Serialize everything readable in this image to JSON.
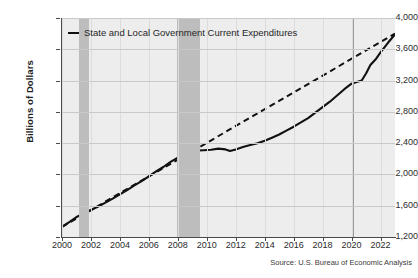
{
  "chart_data": {
    "type": "line",
    "title": "",
    "xlabel": "",
    "ylabel": "Billions of Dollars",
    "source": "Source: U.S. Bureau of Economic Analysis",
    "xlim": [
      2000,
      2023
    ],
    "ylim": [
      1200,
      4000
    ],
    "y_ticks": [
      "1,200",
      "1,600",
      "2,000",
      "2,400",
      "2,800",
      "3,200",
      "3,600",
      "4,000"
    ],
    "y_tick_values": [
      1200,
      1600,
      2000,
      2400,
      2800,
      3200,
      3600,
      4000
    ],
    "x_ticks": [
      "2000",
      "2002",
      "2004",
      "2006",
      "2008",
      "2010",
      "2012",
      "2014",
      "2016",
      "2018",
      "2020",
      "2022"
    ],
    "x_tick_values": [
      2000,
      2002,
      2004,
      2006,
      2008,
      2010,
      2012,
      2014,
      2016,
      2018,
      2020,
      2022
    ],
    "grid": true,
    "legend_position": "top-left",
    "legend": [
      "State and Local Government Current Expenditures"
    ],
    "plot_background": "#ededed",
    "line_color": "#111111",
    "recession_band_color": "#bdbdbd",
    "gridline_color": "#c9c9c9",
    "recession_bands": [
      {
        "start": 2001.2,
        "end": 2001.9
      },
      {
        "start": 2007.95,
        "end": 2009.5
      },
      {
        "start": 2020.1,
        "end": 2020.2
      }
    ],
    "series": [
      {
        "name": "State and Local Government Current Expenditures",
        "style": "solid",
        "x": [
          2000.0,
          2000.5,
          2001.0,
          2001.5,
          2002.0,
          2002.5,
          2003.0,
          2003.5,
          2004.0,
          2004.5,
          2005.0,
          2005.5,
          2006.0,
          2006.5,
          2007.0,
          2007.5,
          2008.0,
          2008.5,
          2009.0,
          2009.4,
          2009.8,
          2010.3,
          2010.8,
          2011.3,
          2011.6,
          2012.0,
          2012.5,
          2013.0,
          2013.5,
          2014.0,
          2014.5,
          2015.0,
          2015.5,
          2016.0,
          2016.5,
          2017.0,
          2017.5,
          2018.0,
          2018.5,
          2019.0,
          2019.5,
          2020.0,
          2020.3,
          2020.7,
          2021.0,
          2021.3,
          2021.7,
          2022.0,
          2022.5,
          2023.0
        ],
        "y": [
          1330,
          1390,
          1455,
          1500,
          1545,
          1590,
          1640,
          1690,
          1745,
          1800,
          1860,
          1915,
          1975,
          2040,
          2095,
          2160,
          2215,
          2265,
          2300,
          2305,
          2310,
          2315,
          2330,
          2320,
          2300,
          2320,
          2350,
          2375,
          2400,
          2430,
          2470,
          2510,
          2560,
          2610,
          2665,
          2720,
          2790,
          2860,
          2930,
          3010,
          3090,
          3160,
          3180,
          3200,
          3290,
          3400,
          3480,
          3560,
          3680,
          3790
        ]
      },
      {
        "name": "Trend",
        "style": "dashed",
        "x": [
          2000.0,
          2023.0
        ],
        "y": [
          1330,
          3800
        ]
      }
    ]
  },
  "legend": {
    "items": [
      {
        "label": "State and Local Government Current Expenditures",
        "swatch": "line-swatch"
      }
    ]
  },
  "axes": {
    "y_title": "Billions of Dollars"
  },
  "footer": {
    "source": "Source: U.S. Bureau of Economic Analysis"
  }
}
